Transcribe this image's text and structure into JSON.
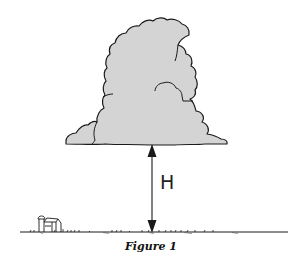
{
  "figure": {
    "caption": "Figure 1",
    "height_label": "H",
    "elements": [
      "cumulus-cloud",
      "height-arrow",
      "ground-line",
      "farmhouse"
    ],
    "colors": {
      "cloud_fill": "#d4d4d4",
      "outline": "#1a1a1a",
      "background": "#ffffff"
    }
  }
}
